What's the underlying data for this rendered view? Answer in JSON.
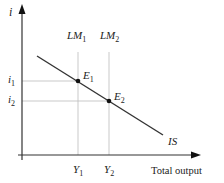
{
  "diagram": {
    "y_axis_label": "i",
    "x_axis_label": "Total output",
    "curves": {
      "is_label": "IS",
      "lm1_main": "LM",
      "lm1_sub": "1",
      "lm2_main": "LM",
      "lm2_sub": "2"
    },
    "points": {
      "e1_main": "E",
      "e1_sub": "1",
      "e2_main": "E",
      "e2_sub": "2"
    },
    "y_ticks": {
      "i1_main": "i",
      "i1_sub": "1",
      "i2_main": "i",
      "i2_sub": "2"
    },
    "x_ticks": {
      "y1_main": "Y",
      "y1_sub": "1",
      "y2_main": "Y",
      "y2_sub": "2"
    },
    "colors": {
      "axis": "#333333",
      "is_line": "#333333",
      "guide_line": "#bbbbbb",
      "point": "#111111"
    }
  }
}
